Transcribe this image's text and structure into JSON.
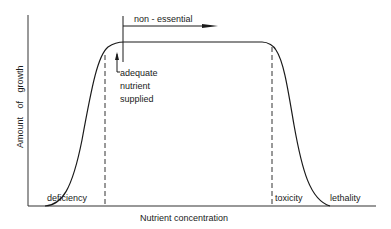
{
  "diagram": {
    "title": "",
    "y_axis_label": "Amount of growth",
    "x_axis_label": "Nutrient concentration",
    "labels": {
      "non_essential": "non - essential",
      "adequate": "adequate",
      "nutrient": "nutrient",
      "supplied": "supplied",
      "deficiency": "deficiency",
      "toxicity": "toxicity",
      "lethality": "lethality"
    },
    "colors": {
      "ink": "#1a1a1a",
      "background": "#ffffff"
    }
  }
}
